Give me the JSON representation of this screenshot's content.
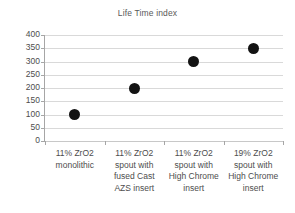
{
  "chart_data": {
    "type": "scatter",
    "title": "Life Time index",
    "xlabel": "",
    "ylabel": "",
    "ylim": [
      0,
      400
    ],
    "yticks": [
      0,
      50,
      100,
      150,
      200,
      250,
      300,
      350,
      400
    ],
    "ytick_labels": [
      "0",
      "50",
      "100",
      "150",
      "200",
      "250",
      "300",
      "350",
      "400"
    ],
    "grid": true,
    "legend": "none",
    "marker_color": "#131313",
    "gridline_color": "#d9d9d9",
    "axis_color": "#a6a6a6",
    "text_color": "#4d4d4d",
    "title_color": "#595959",
    "background_color": "#ffffff",
    "categories": [
      "11% ZrO2 monolithic",
      "11% ZrO2 spout with fused Cast AZS insert",
      "11% ZrO2 spout with High Chrome insert",
      "19% ZrO2 spout with High Chrome insert"
    ],
    "category_lines": [
      [
        "11% ZrO2",
        "monolithic"
      ],
      [
        "11% ZrO2",
        "spout with",
        "fused Cast",
        "AZS insert"
      ],
      [
        "11% ZrO2",
        "spout with",
        "High Chrome",
        "insert"
      ],
      [
        "19% ZrO2",
        "spout with",
        "High Chrome",
        "insert"
      ]
    ],
    "values": [
      100,
      200,
      300,
      350
    ]
  }
}
